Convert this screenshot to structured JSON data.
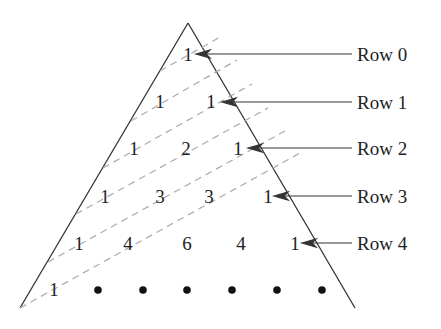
{
  "diagram": {
    "rows": [
      {
        "label": "Row 0",
        "values": [
          "1"
        ]
      },
      {
        "label": "Row 1",
        "values": [
          "1",
          "1"
        ]
      },
      {
        "label": "Row 2",
        "values": [
          "1",
          "2",
          "1"
        ]
      },
      {
        "label": "Row 3",
        "values": [
          "1",
          "3",
          "3",
          "1"
        ]
      },
      {
        "label": "Row 4",
        "values": [
          "1",
          "4",
          "6",
          "4",
          "1"
        ]
      }
    ],
    "last_row": {
      "first_value": "1",
      "continuation": "dots"
    },
    "colors": {
      "line": "#333333",
      "dashed": "#aaaaaa",
      "text": "#222222"
    }
  }
}
